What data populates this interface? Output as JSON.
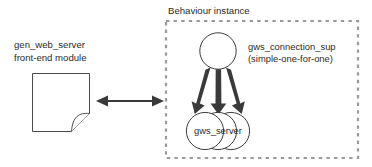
{
  "figure": {
    "background_color": "#ffffff",
    "stroke_color": "#3c3c3c",
    "dashed_border_color": "#9a9a9a",
    "arrow_color": "#3a3a3a",
    "text_color": "#2b2b2b"
  },
  "container": {
    "title": "Behaviour instance",
    "border_style": "dashed"
  },
  "left_module": {
    "label_line1": "gen_web_server",
    "label_line2": "front-end module",
    "icon": "document-page-icon"
  },
  "connector": {
    "type": "double-headed-arrow",
    "direction": "bidirectional"
  },
  "supervisor": {
    "shape": "circle",
    "label_line1": "gws_connection_sup",
    "label_line2": "(simple-one-for-one)"
  },
  "workers": {
    "shape": "stacked-circles",
    "count": 3,
    "label": "gws_server"
  },
  "supervision_arrows": {
    "count": 3,
    "style": "tapered-solid"
  }
}
